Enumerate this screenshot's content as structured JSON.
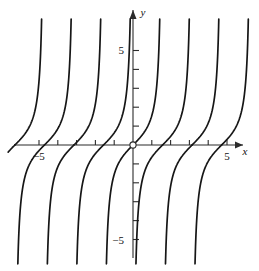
{
  "figure": {
    "name": "tangent-family-plot",
    "background": "#ffffff",
    "ink_color": "#161616",
    "axis_color": "#2b2b2b",
    "width": 259,
    "height": 271
  },
  "axes": {
    "x_label": "x",
    "y_label": "y",
    "origin_marker": "open-circle",
    "x_tick_labels": [
      {
        "text": "−5",
        "value": -5
      },
      {
        "text": "5",
        "value": 5
      }
    ],
    "y_tick_labels": [
      {
        "text": "5",
        "value": 5
      },
      {
        "text": "−5",
        "value": -5
      }
    ]
  },
  "chart_data": {
    "type": "line",
    "title": "",
    "xlabel": "x",
    "ylabel": "y",
    "grid": false,
    "legend": null,
    "xlim": [
      -6.8,
      6.3
    ],
    "ylim": [
      -6.6,
      6.8
    ],
    "x_ticks": [
      -5,
      -4,
      -3,
      -2,
      -1,
      1,
      2,
      3,
      4,
      5
    ],
    "y_ticks": [
      -5,
      -4,
      -3,
      -2,
      -1,
      1,
      2,
      3,
      4,
      5
    ],
    "x_tick_labels_shown": [
      -5,
      5
    ],
    "y_tick_labels_shown": [
      -5,
      5
    ],
    "function": "y = tan(x)",
    "period": 3.14159,
    "asymptote_spacing": 3.14159,
    "branch_zero_crossings": [
      -6.2832,
      -3.1416,
      0,
      3.1416,
      6.2832
    ],
    "series": [
      {
        "name": "branch-1",
        "zero_x": -6.2832,
        "asymptote_x": -4.7124
      },
      {
        "name": "branch-2",
        "zero_x": -4.7124,
        "asymptote_x": -3.1416
      },
      {
        "name": "branch-3",
        "zero_x": -3.1416,
        "asymptote_x": -1.5708
      },
      {
        "name": "branch-4",
        "zero_x": -1.5708,
        "asymptote_x": 0.0
      },
      {
        "name": "branch-5",
        "zero_x": 0.0,
        "asymptote_x": 1.5708
      },
      {
        "name": "branch-6",
        "zero_x": 1.5708,
        "asymptote_x": 3.1416
      },
      {
        "name": "branch-7",
        "zero_x": 3.1416,
        "asymptote_x": 4.7124
      },
      {
        "name": "branch-8",
        "zero_x": 4.7124,
        "asymptote_x": 6.2832
      }
    ]
  }
}
